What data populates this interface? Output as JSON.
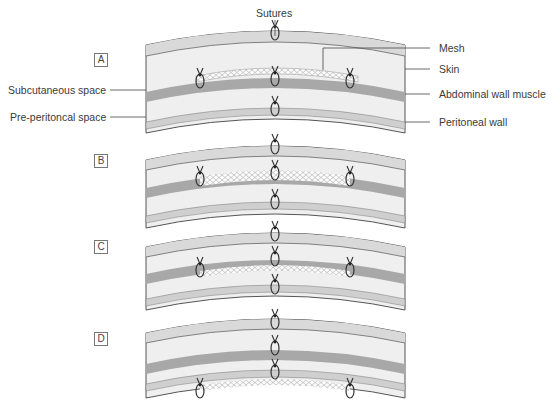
{
  "figure": {
    "top_label": "Sutures",
    "left_labels": [
      "Subcutaneous space",
      "Pre-peritoncal space"
    ],
    "right_labels": [
      "Mesh",
      "Skin",
      "Abdominal wall muscle",
      "Peritoneal wall"
    ],
    "panels": [
      {
        "letter": "A",
        "mesh_position": "onlay"
      },
      {
        "letter": "B",
        "mesh_position": "inlay"
      },
      {
        "letter": "C",
        "mesh_position": "sublay"
      },
      {
        "letter": "D",
        "mesh_position": "underlay"
      }
    ]
  },
  "colors": {
    "skin": "#d9d9d9",
    "fat": "#efefef",
    "muscle": "#a8a8a8",
    "peritoneum": "#cfcfcf",
    "outline": "#555555",
    "mesh": "#ffffff"
  }
}
